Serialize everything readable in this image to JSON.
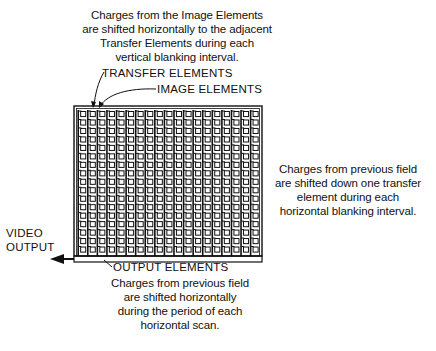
{
  "captions": {
    "top": [
      "Charges from the Image Elements",
      "are shifted horizontally to the adjacent",
      "Transfer Elements during each",
      "vertical blanking interval."
    ],
    "right": [
      "Charges from previous field",
      "are shifted down one transfer",
      "element during each",
      "horizontal blanking interval."
    ],
    "bottom": [
      "Charges from previous field",
      "are shifted horizontally",
      "during the period of each",
      "horizontal scan."
    ]
  },
  "labels": {
    "transfer_elements": "TRANSFER ELEMENTS",
    "image_elements": "IMAGE ELEMENTS",
    "video_output_line1": "VIDEO",
    "video_output_line2": "OUTPUT",
    "output_elements": "OUTPUT ELEMENTS"
  },
  "grid": {
    "columns": 19,
    "rows": 17,
    "x": 74,
    "y": 106,
    "width": 188,
    "height": 150
  },
  "colors": {
    "line": "#111111",
    "background": "#ffffff"
  }
}
